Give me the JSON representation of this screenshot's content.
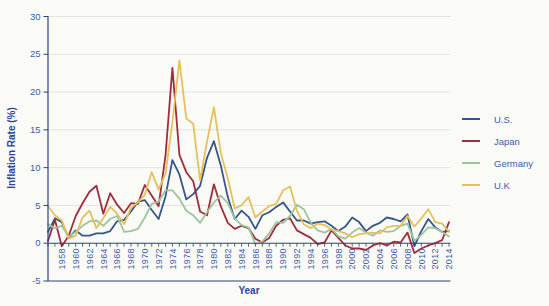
{
  "chart_data": {
    "type": "line",
    "xlabel": "Year",
    "ylabel": "Inflation Rate (%)",
    "ylim": [
      -5,
      30
    ],
    "yticks": [
      30,
      25,
      20,
      15,
      10,
      5,
      0,
      -5
    ],
    "grid": "horizontal",
    "legend_position": "right",
    "x": [
      1956,
      1957,
      1958,
      1959,
      1960,
      1961,
      1962,
      1963,
      1964,
      1965,
      1966,
      1967,
      1968,
      1969,
      1970,
      1971,
      1972,
      1973,
      1974,
      1975,
      1976,
      1977,
      1978,
      1979,
      1980,
      1981,
      1982,
      1983,
      1984,
      1985,
      1986,
      1987,
      1988,
      1989,
      1990,
      1991,
      1992,
      1993,
      1994,
      1995,
      1996,
      1997,
      1998,
      1999,
      2000,
      2001,
      2002,
      2003,
      2004,
      2005,
      2006,
      2007,
      2008,
      2009,
      2010,
      2011,
      2012,
      2013,
      2014
    ],
    "xtick_label_years": [
      1958,
      1960,
      1962,
      1964,
      1966,
      1968,
      1970,
      1972,
      1974,
      1976,
      1978,
      1980,
      1982,
      1984,
      1986,
      1988,
      1990,
      1992,
      1994,
      1996,
      1998,
      2000,
      2002,
      2004,
      2006,
      2008,
      2010,
      2012,
      2014
    ],
    "series": [
      {
        "name": "U.S.",
        "color": "#35568b",
        "values": [
          1.5,
          3.3,
          2.8,
          0.7,
          1.7,
          1.0,
          1.0,
          1.3,
          1.3,
          1.6,
          2.9,
          3.1,
          4.2,
          5.5,
          5.7,
          4.4,
          3.2,
          6.2,
          11.0,
          9.1,
          5.8,
          6.5,
          7.6,
          11.3,
          13.5,
          10.3,
          6.1,
          3.2,
          4.3,
          3.5,
          1.9,
          3.7,
          4.1,
          4.8,
          5.4,
          4.2,
          3.0,
          3.0,
          2.6,
          2.8,
          2.9,
          2.3,
          1.6,
          2.2,
          3.4,
          2.8,
          1.6,
          2.3,
          2.7,
          3.4,
          3.2,
          2.9,
          3.8,
          -0.4,
          1.6,
          3.2,
          2.1,
          1.5,
          1.6
        ]
      },
      {
        "name": "Japan",
        "color": "#a02c3d",
        "values": [
          0.3,
          3.1,
          -0.4,
          1.0,
          3.6,
          5.3,
          6.8,
          7.6,
          3.9,
          6.6,
          5.1,
          4.0,
          5.3,
          5.2,
          7.7,
          6.3,
          4.9,
          11.6,
          23.2,
          11.7,
          9.4,
          8.2,
          4.2,
          3.7,
          7.8,
          4.9,
          2.7,
          1.9,
          2.3,
          2.0,
          0.6,
          0.1,
          0.7,
          2.3,
          3.1,
          3.3,
          1.7,
          1.2,
          0.7,
          -0.1,
          0.1,
          1.7,
          0.7,
          -0.3,
          -0.7,
          -0.7,
          -0.9,
          -0.3,
          0.0,
          -0.3,
          0.2,
          0.1,
          1.4,
          -1.3,
          -0.7,
          -0.3,
          0.0,
          0.4,
          2.8
        ]
      },
      {
        "name": "Germany",
        "color": "#9dc49c",
        "values": [
          2.5,
          2.0,
          2.3,
          0.9,
          1.5,
          2.3,
          2.9,
          3.0,
          2.3,
          3.2,
          3.6,
          1.5,
          1.6,
          1.9,
          3.4,
          5.2,
          5.5,
          7.0,
          7.0,
          5.9,
          4.3,
          3.7,
          2.7,
          4.1,
          5.4,
          6.3,
          5.3,
          3.3,
          2.4,
          2.1,
          -0.1,
          0.2,
          1.3,
          2.8,
          2.7,
          3.6,
          5.1,
          4.5,
          2.7,
          1.7,
          1.4,
          1.9,
          0.9,
          0.6,
          1.4,
          2.0,
          1.4,
          1.0,
          1.7,
          1.5,
          1.6,
          2.3,
          2.6,
          0.3,
          1.1,
          2.1,
          2.0,
          1.5,
          0.9
        ]
      },
      {
        "name": "U.K",
        "color": "#e5c15c",
        "values": [
          4.9,
          3.7,
          3.0,
          0.6,
          1.0,
          3.4,
          4.3,
          2.0,
          3.3,
          4.8,
          3.9,
          2.5,
          4.7,
          5.4,
          6.4,
          9.4,
          7.1,
          9.2,
          16.0,
          24.2,
          16.5,
          15.8,
          8.3,
          13.4,
          18.0,
          11.9,
          8.6,
          4.6,
          5.0,
          6.1,
          3.4,
          4.2,
          4.9,
          5.2,
          7.0,
          7.5,
          4.3,
          2.5,
          2.0,
          2.6,
          2.4,
          1.8,
          1.6,
          1.3,
          0.8,
          1.2,
          1.3,
          1.4,
          1.3,
          2.1,
          2.3,
          2.3,
          3.6,
          2.2,
          3.3,
          4.5,
          2.8,
          2.6,
          1.5
        ]
      }
    ]
  },
  "styles": {
    "background": "#fafaf7",
    "grid_color": "#e3e3e0",
    "axis_color": "#2a4379",
    "tick_label_color": "#3f5cac",
    "title_color": "#2e459c",
    "legend_text_color": "#4060a8"
  }
}
